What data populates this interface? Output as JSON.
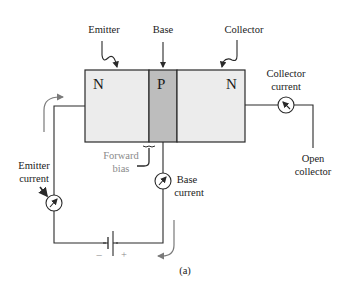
{
  "diagram": {
    "type": "NPN transistor bias diagram",
    "caption": "(a)",
    "regions": [
      {
        "label": "N",
        "name": "Emitter",
        "fill": "#ececec"
      },
      {
        "label": "P",
        "name": "Base",
        "fill": "#bdbdbd"
      },
      {
        "label": "N",
        "name": "Collector",
        "fill": "#ececec"
      }
    ],
    "labels": {
      "emitter": "Emitter",
      "base": "Base",
      "collector": "Collector",
      "collector_current_1": "Collector",
      "collector_current_2": "current",
      "emitter_current_1": "Emitter",
      "emitter_current_2": "current",
      "base_current_1": "Base",
      "base_current_2": "current",
      "forward_bias_1": "Forward",
      "forward_bias_2": "bias",
      "open_collector_1": "Open",
      "open_collector_2": "collector",
      "battery_minus": "–",
      "battery_plus": "+"
    },
    "meters": [
      "emitter-current-meter",
      "base-current-meter",
      "collector-current-meter"
    ],
    "colors": {
      "wire": "#2a2a2a",
      "arrow_grey": "#7a7a7a",
      "n_region": "#ececec",
      "p_region": "#bdbdbd"
    }
  }
}
